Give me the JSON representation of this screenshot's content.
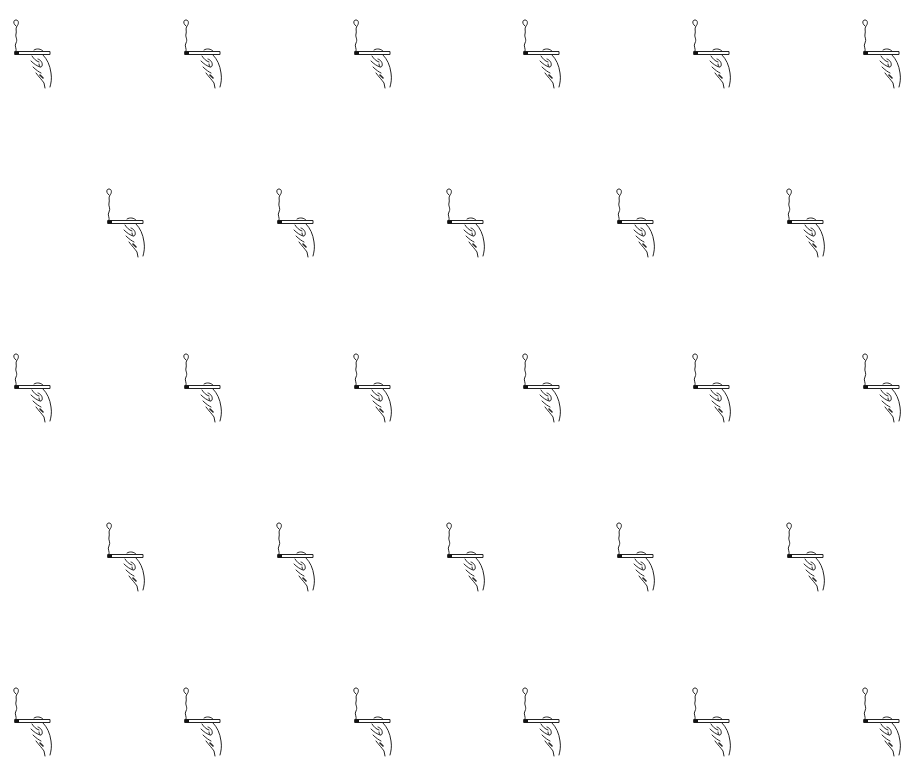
{
  "pattern": {
    "background": "#ffffff",
    "ink": "#222222",
    "motif": "hand-holding-cigarette-icon",
    "tiles": [
      {
        "x": 10,
        "y": 17
      },
      {
        "x": 180,
        "y": 17
      },
      {
        "x": 350,
        "y": 17
      },
      {
        "x": 519,
        "y": 17
      },
      {
        "x": 689,
        "y": 17
      },
      {
        "x": 859,
        "y": 17
      },
      {
        "x": 103,
        "y": 186
      },
      {
        "x": 273,
        "y": 186
      },
      {
        "x": 443,
        "y": 186
      },
      {
        "x": 613,
        "y": 186
      },
      {
        "x": 783,
        "y": 186
      },
      {
        "x": 10,
        "y": 351
      },
      {
        "x": 180,
        "y": 351
      },
      {
        "x": 350,
        "y": 351
      },
      {
        "x": 519,
        "y": 351
      },
      {
        "x": 689,
        "y": 351
      },
      {
        "x": 859,
        "y": 351
      },
      {
        "x": 103,
        "y": 520
      },
      {
        "x": 273,
        "y": 520
      },
      {
        "x": 443,
        "y": 520
      },
      {
        "x": 613,
        "y": 520
      },
      {
        "x": 783,
        "y": 520
      },
      {
        "x": 10,
        "y": 685
      },
      {
        "x": 180,
        "y": 685
      },
      {
        "x": 350,
        "y": 685
      },
      {
        "x": 519,
        "y": 685
      },
      {
        "x": 689,
        "y": 685
      },
      {
        "x": 859,
        "y": 685
      }
    ]
  }
}
